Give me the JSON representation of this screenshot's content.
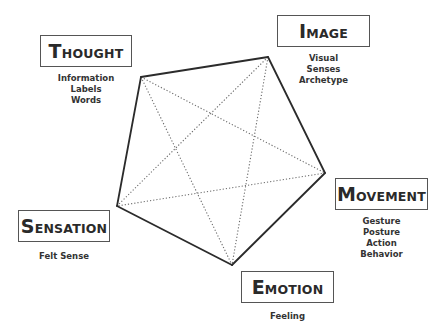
{
  "diagram": {
    "type": "pentagon-star",
    "nodes": [
      {
        "id": "thought",
        "title_initial": "T",
        "title_rest": "HOUGHT",
        "title": "Thought",
        "descriptors": [
          "Information",
          "Labels",
          "Words"
        ]
      },
      {
        "id": "image",
        "title_initial": "I",
        "title_rest": "MAGE",
        "title": "Image",
        "descriptors": [
          "Visual",
          "Senses",
          "Archetype"
        ]
      },
      {
        "id": "movement",
        "title_initial": "M",
        "title_rest": "OVEMENT",
        "title": "Movement",
        "descriptors": [
          "Gesture",
          "Posture",
          "Action",
          "Behavior"
        ]
      },
      {
        "id": "emotion",
        "title_initial": "E",
        "title_rest": "MOTION",
        "title": "Emotion",
        "descriptors": [
          "Feeling"
        ]
      },
      {
        "id": "sensation",
        "title_initial": "S",
        "title_rest": "ENSATION",
        "title": "Sensation",
        "descriptors": [
          "Felt Sense"
        ]
      }
    ],
    "outer_edges": [
      [
        "thought",
        "image"
      ],
      [
        "image",
        "movement"
      ],
      [
        "movement",
        "emotion"
      ],
      [
        "emotion",
        "sensation"
      ],
      [
        "sensation",
        "thought"
      ]
    ],
    "inner_edges_dotted": [
      [
        "thought",
        "movement"
      ],
      [
        "thought",
        "emotion"
      ],
      [
        "image",
        "emotion"
      ],
      [
        "image",
        "sensation"
      ],
      [
        "movement",
        "sensation"
      ]
    ],
    "colors": {
      "line": "#2b2b2b",
      "dotted_line": "#6a6a6a",
      "box_border": "#555555",
      "background": "#ffffff"
    }
  }
}
